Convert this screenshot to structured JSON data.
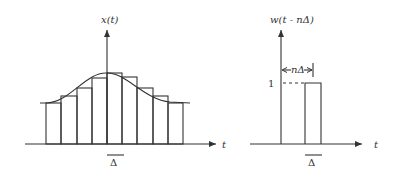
{
  "left_panel": {
    "y_label": "x(t)",
    "x_label": "t",
    "delta_label": "Δ",
    "bars": {
      "edges_x": [
        46,
        61,
        77,
        92,
        107,
        122,
        137,
        153,
        168,
        183
      ],
      "tops_y": [
        103,
        96,
        88,
        78,
        73,
        77,
        88,
        96,
        103
      ]
    },
    "curve_path": "M 40 103 L 46 103 C 70 103, 85 72, 107 73 C 125 72, 145 100, 170 102 L 190 103"
  },
  "right_panel": {
    "y_label": "w(t - nΔ)",
    "x_label": "t",
    "level_label": "1",
    "offset_label": "nΔ",
    "delta_label": "Δ"
  }
}
